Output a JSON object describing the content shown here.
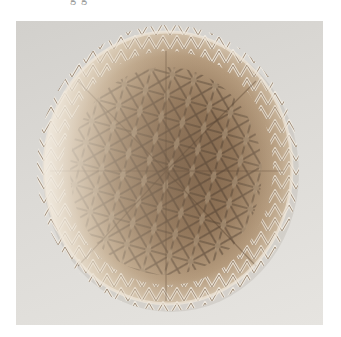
{
  "caption_fragment": "g   g",
  "photo": {
    "subject": "woven-basket",
    "alt": "Overhead view of a round woven basket with star-shaped lattice pattern",
    "colors": {
      "background": "#dad8d4",
      "rim_light": "#eee6d8",
      "weave_mid": "#b89a78",
      "weave_dark": "#6e5640",
      "shadow": "#4a3a2c",
      "gap": "#c9c4bb"
    }
  }
}
